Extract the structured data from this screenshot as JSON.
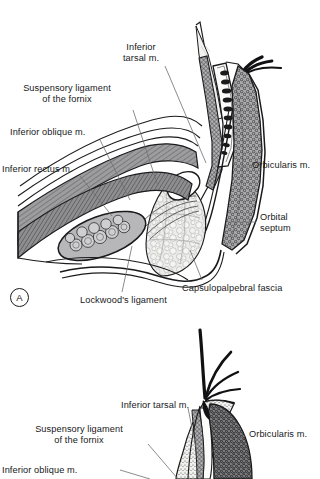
{
  "figure": {
    "background_color": "#ffffff",
    "ink_color": "#18181a",
    "leader_color": "#6e6e72",
    "palette": {
      "muscle_gray": "#9a9a9c",
      "muscle_dark": "#6d6d70",
      "fat_light": "#e9e9e6",
      "tarsus_white": "#fbfbfa",
      "gland_black": "#1b1b1d",
      "septum_gray": "#b9b9bb",
      "skin_tone": "#d9d9d6"
    }
  },
  "panels": [
    {
      "id": "A",
      "marker": "A",
      "labels": [
        {
          "name": "inferior-tarsal-muscle",
          "text": "Inferior\ntarsal m.",
          "x": 141,
          "y": 42,
          "align": "c"
        },
        {
          "name": "suspensory-ligament-fornix",
          "text": "Suspensory ligament\nof the fornix",
          "x": 67,
          "y": 83,
          "align": "c"
        },
        {
          "name": "inferior-oblique-muscle",
          "text": "Inferior oblique m.",
          "x": 10,
          "y": 127,
          "align": "l"
        },
        {
          "name": "inferior-rectus-muscle",
          "text": "Inferior rectus m.",
          "x": 2,
          "y": 164,
          "align": "l"
        },
        {
          "name": "orbicularis-muscle",
          "text": "Orbicularis m.",
          "x": 252,
          "y": 164,
          "align": "l"
        },
        {
          "name": "orbital-septum",
          "text": "Orbital\nseptum",
          "x": 260,
          "y": 212,
          "align": "l"
        },
        {
          "name": "capsulopalpebral-fascia",
          "text": "Capsulopalpebral fascia",
          "x": 182,
          "y": 285,
          "align": "l"
        },
        {
          "name": "lockwoods-ligament",
          "text": "Lockwood's ligament",
          "x": 80,
          "y": 297,
          "align": "l"
        }
      ]
    },
    {
      "id": "B",
      "marker": "",
      "labels": [
        {
          "name": "inferior-tarsal-muscle-b",
          "text": "Inferior tarsal m.",
          "x": 121,
          "y": 402,
          "align": "l"
        },
        {
          "name": "suspensory-ligament-fornix-b",
          "text": "Suspensory ligament\nof the fornix",
          "x": 78,
          "y": 426,
          "align": "c"
        },
        {
          "name": "orbicularis-muscle-b",
          "text": "Orbicularis m.",
          "x": 249,
          "y": 432,
          "align": "l"
        },
        {
          "name": "inferior-oblique-muscle-b",
          "text": "Inferior oblique m.",
          "x": 2,
          "y": 468,
          "align": "l"
        }
      ]
    }
  ],
  "structures": {
    "tarsal_plate": "tarsal plate containing meibomian glands",
    "meibomian_glands_count": 9,
    "eyelashes_count_top": 3,
    "eyelashes_count_bottom": 5,
    "orbital_fat": "lobulated orbital fat pad",
    "inferior_rectus": "inferior rectus muscle belly",
    "inferior_oblique": "inferior oblique muscle in cross-section",
    "conjunctival_fornix": "inferior conjunctival fornix"
  }
}
